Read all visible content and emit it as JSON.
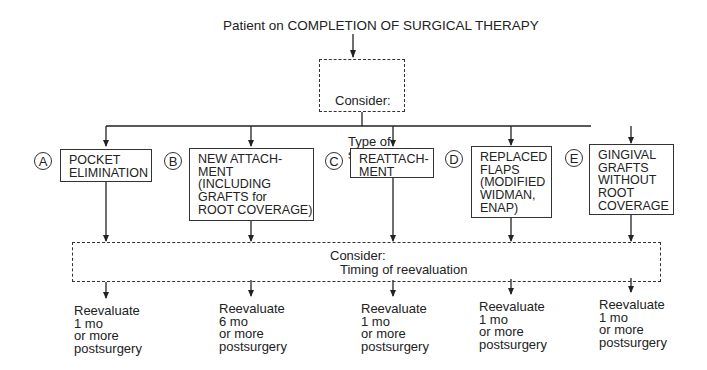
{
  "title": "Patient on COMPLETION OF SURGICAL THERAPY",
  "consider_type": {
    "label": "Consider:",
    "text": "Type of\nsurgery"
  },
  "options": [
    {
      "letter": "A",
      "text": "POCKET\nELIMINATION"
    },
    {
      "letter": "B",
      "text": "NEW ATTACH-\nMENT\n(INCLUDING\nGRAFTS for\nROOT COVERAGE)"
    },
    {
      "letter": "C",
      "text": "REATTACH-\nMENT"
    },
    {
      "letter": "D",
      "text": "REPLACED\nFLAPS\n(MODIFIED\nWIDMAN,\nENAP)"
    },
    {
      "letter": "E",
      "text": "GINGIVAL\nGRAFTS\nWITHOUT\nROOT\nCOVERAGE"
    }
  ],
  "consider_timing": {
    "label": "Consider:",
    "text": "Timing of reevaluation"
  },
  "outcomes": [
    "Reevaluate\n1 mo\nor more\npostsurgery",
    "Reevaluate\n6 mo\nor more\npostsurgery",
    "Reevaluate\n1 mo\nor more\npostsurgery",
    "Reevaluate\n1 mo\nor more\npostsurgery",
    "Reevaluate\n1 mo\nor more\npostsurgery"
  ]
}
